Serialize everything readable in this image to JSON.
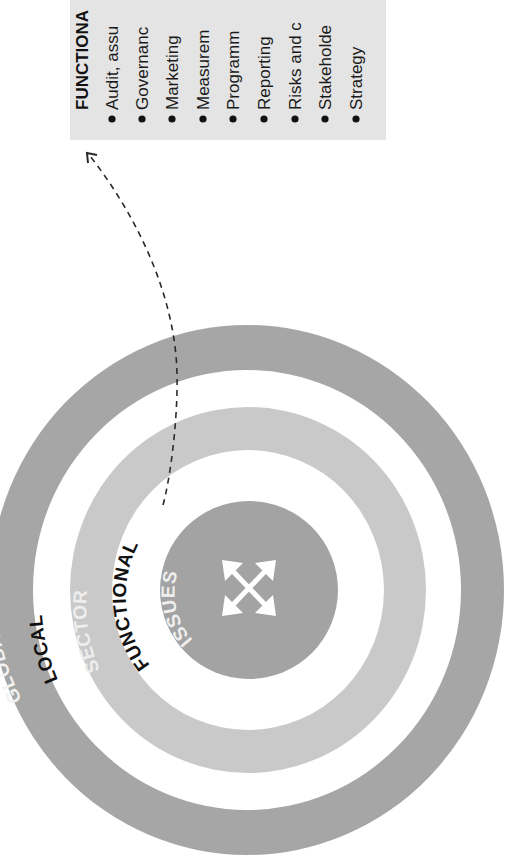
{
  "diagram": {
    "rings": [
      {
        "id": "global",
        "label": "GLOBAL",
        "fill": "#a6a6a6",
        "label_color": "#f2f2f2",
        "outer_r": 262,
        "inner_r": 218
      },
      {
        "id": "local",
        "label": "LOCAL",
        "fill": "#ffffff",
        "label_color": "#111111",
        "outer_r": 218,
        "inner_r": 183
      },
      {
        "id": "sector",
        "label": "SECTOR",
        "fill": "#c9c9c9",
        "label_color": "#eeeeee",
        "outer_r": 183,
        "inner_r": 140
      },
      {
        "id": "functional",
        "label": "FUNCTIONAL",
        "fill": "#ffffff",
        "label_color": "#111111",
        "outer_r": 140,
        "inner_r": 90
      },
      {
        "id": "issues",
        "label": "ISSUES",
        "fill": "#a3a3a3",
        "label_color": "#eeeeee",
        "outer_r": 90,
        "inner_r": 0
      }
    ],
    "center_icon": "four-way-arrows-icon",
    "connector": {
      "style": "dashed",
      "from": "functional",
      "to": "callout-box"
    },
    "callout": {
      "heading": "FUNCTIONA",
      "background": "#e4e4e4",
      "items": [
        "Audit, assu",
        "Governanc",
        "Marketing",
        "Measurem",
        "Programm",
        "Reporting",
        "Risks and c",
        "Stakeholde",
        "Strategy"
      ]
    }
  }
}
